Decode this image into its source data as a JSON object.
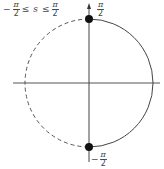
{
  "diagram": {
    "range_label": {
      "lower_sign": "−",
      "lower_num": "π",
      "lower_den": "2",
      "op1": "≤",
      "variable": "s",
      "op2": "≤",
      "upper_num": "π",
      "upper_den": "2"
    },
    "top_point_label": {
      "num": "π",
      "den": "2"
    },
    "bottom_point_label": {
      "sign": "−",
      "num": "π",
      "den": "2"
    },
    "circle": {
      "cx": 89,
      "cy": 83,
      "r": 64,
      "left_half": "dashed",
      "right_half": "solid"
    },
    "points": [
      {
        "name": "top",
        "x": 89,
        "y": 19
      },
      {
        "name": "bottom",
        "x": 89,
        "y": 147
      }
    ],
    "colors": {
      "stroke": "#444444",
      "dot": "#111111"
    }
  }
}
